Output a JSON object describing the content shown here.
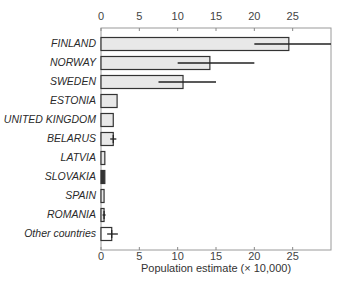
{
  "chart_data": {
    "type": "bar",
    "orientation": "horizontal",
    "title": "",
    "xlabel": "Population estimate (× 10,000)",
    "ylabel": "",
    "xlim": [
      0,
      30
    ],
    "xticks": [
      0,
      5,
      10,
      15,
      20,
      25
    ],
    "xtick_labels": [
      "0",
      "5",
      "10",
      "15",
      "20",
      "25"
    ],
    "ticks_top_and_bottom": true,
    "grid": false,
    "legend": null,
    "categories": [
      "FINLAND",
      "NORWAY",
      "SWEDEN",
      "ESTONIA",
      "UNITED KINGDOM",
      "BELARUS",
      "LATVIA",
      "SLOVAKIA",
      "SPAIN",
      "ROMANIA",
      "Other countries"
    ],
    "category_italic": true,
    "values": [
      24.5,
      14.2,
      10.7,
      2.1,
      1.6,
      1.6,
      0.5,
      0.5,
      0.4,
      0.4,
      1.4
    ],
    "error_ranges": [
      [
        20,
        30
      ],
      [
        10,
        20
      ],
      [
        7.5,
        15
      ],
      null,
      null,
      [
        1.2,
        2.0
      ],
      null,
      null,
      null,
      [
        0.2,
        0.6
      ],
      [
        0.8,
        2.2
      ]
    ],
    "fills": [
      "#e8e8e8",
      "#e8e8e8",
      "#e8e8e8",
      "#e8e8e8",
      "#e8e8e8",
      "#e8e8e8",
      "#e8e8e8",
      "#333333",
      "#e8e8e8",
      "#e8e8e8",
      "#ffffff"
    ]
  },
  "colors": {
    "bar_fill": "#e8e8e8",
    "bar_stroke": "#333333",
    "highlight_fill": "#333333",
    "other_fill": "#ffffff",
    "axis": "#888888",
    "error": "#222222"
  }
}
